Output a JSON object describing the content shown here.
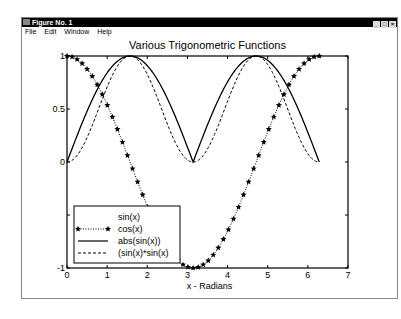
{
  "window": {
    "title": "Figure No. 1",
    "controls": [
      "_",
      "□",
      "×"
    ],
    "menu": [
      "File",
      "Edit",
      "Window",
      "Help"
    ]
  },
  "chart_data": {
    "type": "line",
    "title": "Various Trigonometric Functions",
    "xlabel": "x - Radians",
    "ylabel": "",
    "xlim": [
      0,
      7
    ],
    "ylim": [
      -1,
      1
    ],
    "xticks": [
      "0",
      "1",
      "2",
      "3",
      "4",
      "5",
      "6",
      "7"
    ],
    "yticks": [
      "-1",
      "-0.5",
      "0",
      "0.5",
      "1"
    ],
    "ytick_labels_visible": [
      "-1",
      "0",
      "0.5",
      "1"
    ],
    "x_domain": [
      0,
      6.2832
    ],
    "grid": false,
    "legend_position": "lower left",
    "series": [
      {
        "name": "sin(x)",
        "style": "none",
        "note": "legend entry without visible line"
      },
      {
        "name": "cos(x)",
        "style": "dotted with star markers"
      },
      {
        "name": "abs(sin(x))",
        "style": "solid"
      },
      {
        "name": "(sin(x)*sin(x)",
        "style": "dashed"
      }
    ]
  }
}
